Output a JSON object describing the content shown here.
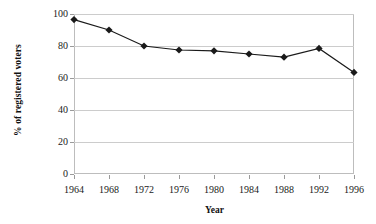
{
  "chart_data": {
    "type": "line",
    "title": "",
    "xlabel": "Year",
    "ylabel": "% of registered voters",
    "categories": [
      "1964",
      "1968",
      "1972",
      "1976",
      "1980",
      "1984",
      "1988",
      "1992",
      "1996"
    ],
    "values": [
      96.5,
      90,
      80,
      77.5,
      77,
      75,
      73,
      78.5,
      63.5
    ],
    "ylim": [
      0,
      100
    ],
    "ytick_labels": [
      "0",
      "20",
      "40",
      "60",
      "80",
      "100"
    ],
    "ytick_values": [
      0,
      20,
      40,
      60,
      80,
      100
    ],
    "grid": "horizontal",
    "legend": "none",
    "marker": "filled-diamond",
    "series_color": "#1a1a1a",
    "gridline_color": "#cccccc",
    "frame_color": "#bdbdbd",
    "background_color": "#ffffff"
  }
}
